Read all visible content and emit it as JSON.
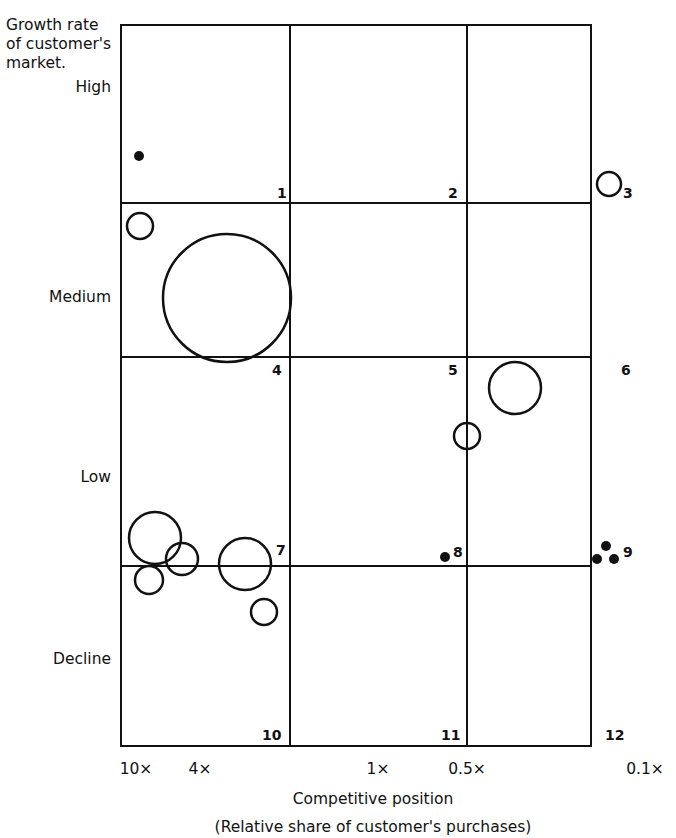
{
  "chart_data": {
    "type": "scatter",
    "subtype": "bubble-matrix",
    "title": "",
    "ylabel": "Growth rate of customer's market.",
    "xlabel": "Competitive position",
    "xlabel_sub": "(Relative share of customer's purchases)",
    "y_categories": [
      "High",
      "Medium",
      "Low",
      "Decline"
    ],
    "x_tick_labels": [
      "10×",
      "4×",
      "1×",
      "0.5×",
      "0.1×"
    ],
    "grid": {
      "rows": 4,
      "cols": 3,
      "cell_numbers": [
        "1",
        "2",
        "3",
        "4",
        "5",
        "6",
        "7",
        "8",
        "9",
        "10",
        "11",
        "12"
      ]
    },
    "points": [
      {
        "cell": 1,
        "x_px": 139,
        "y_px": 156,
        "r": 5,
        "filled": true
      },
      {
        "cell": 3,
        "x_px": 609,
        "y_px": 184,
        "r": 12,
        "filled": false
      },
      {
        "cell": 4,
        "x_px": 140,
        "y_px": 226,
        "r": 13,
        "filled": false
      },
      {
        "cell": 4,
        "x_px": 227,
        "y_px": 298,
        "r": 64,
        "filled": false
      },
      {
        "cell": 6,
        "x_px": 515,
        "y_px": 388,
        "r": 26,
        "filled": false
      },
      {
        "cell": 5,
        "x_px": 467,
        "y_px": 436,
        "r": 13,
        "filled": false
      },
      {
        "cell": 7,
        "x_px": 155,
        "y_px": 538,
        "r": 26,
        "filled": false
      },
      {
        "cell": 7,
        "x_px": 182,
        "y_px": 559,
        "r": 16,
        "filled": false
      },
      {
        "cell": 7,
        "x_px": 149,
        "y_px": 580,
        "r": 14,
        "filled": false
      },
      {
        "cell": 7,
        "x_px": 245,
        "y_px": 564,
        "r": 26,
        "filled": false
      },
      {
        "cell": 10,
        "x_px": 264,
        "y_px": 612,
        "r": 13,
        "filled": false
      },
      {
        "cell": 8,
        "x_px": 445,
        "y_px": 557,
        "r": 5,
        "filled": true
      },
      {
        "cell": 9,
        "x_px": 606,
        "y_px": 546,
        "r": 5,
        "filled": true
      },
      {
        "cell": 9,
        "x_px": 597,
        "y_px": 559,
        "r": 5,
        "filled": true
      },
      {
        "cell": 9,
        "x_px": 614,
        "y_px": 559,
        "r": 5,
        "filled": true
      }
    ],
    "legend": null
  },
  "labels": {
    "ytitle": "Growth rate of customer's market.",
    "high": "High",
    "medium": "Medium",
    "low": "Low",
    "decline": "Decline",
    "x10": "10×",
    "x4": "4×",
    "x1": "1×",
    "x05": "0.5×",
    "x01": "0.1×",
    "xtitle": "Competitive position",
    "xsub": "(Relative share of customer's purchases)",
    "cells": [
      "1",
      "2",
      "3",
      "4",
      "5",
      "6",
      "7",
      "8",
      "9",
      "10",
      "11",
      "12"
    ]
  }
}
